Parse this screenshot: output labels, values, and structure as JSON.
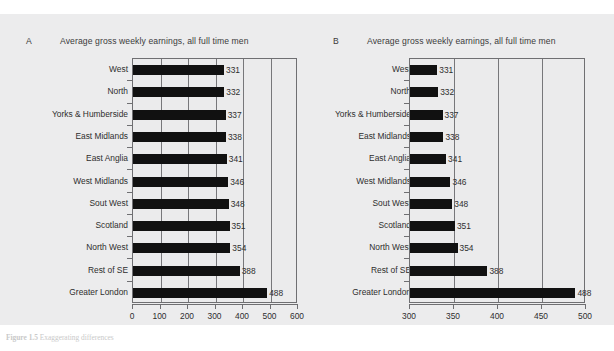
{
  "figure": {
    "caption_label": "Figure 1.5",
    "caption_text": "Exaggerating differences"
  },
  "colors": {
    "panel_background": "#ececed",
    "plot_background": "#ebebec",
    "bar_fill": "#111111",
    "axis_line": "#6f6f72",
    "gridline": "#77777a",
    "text": "#2e2e2e"
  },
  "categories": [
    "West",
    "North",
    "Yorks & Humberside",
    "East Midlands",
    "East Anglia",
    "West Midlands",
    "Sout West",
    "Scotland",
    "North West",
    "Rest of SE",
    "Greater London"
  ],
  "values": [
    331,
    332,
    337,
    338,
    341,
    346,
    348,
    351,
    354,
    388,
    488
  ],
  "value_labels": [
    "331",
    "332",
    "337",
    "338",
    "341",
    "346",
    "348",
    "351",
    "354",
    "388",
    "488"
  ],
  "panels": [
    {
      "letter": "A",
      "title": "Average gross weekly earnings, all full time men",
      "xlim": [
        0,
        600
      ],
      "xticks": [
        0,
        100,
        200,
        300,
        400,
        500,
        600
      ],
      "xticklabels": [
        "0",
        "100",
        "200",
        "300",
        "400",
        "500",
        "600"
      ]
    },
    {
      "letter": "B",
      "title": "Average gross weekly earnings, all full time men",
      "xlim": [
        300,
        500
      ],
      "xticks": [
        300,
        350,
        400,
        450,
        500
      ],
      "xticklabels": [
        "300",
        "350",
        "400",
        "450",
        "500"
      ]
    }
  ],
  "chart_data": {
    "type": "bar",
    "title": "Average gross weekly earnings, all full time men",
    "subtitle": "",
    "xlabel": "",
    "ylabel": "",
    "orientation": "horizontal",
    "grid": true,
    "legend": "none",
    "categories": [
      "West",
      "North",
      "Yorks & Humberside",
      "East Midlands",
      "East Anglia",
      "West Midlands",
      "Sout West",
      "Scotland",
      "North West",
      "Rest of SE",
      "Greater London"
    ],
    "values": [
      331,
      332,
      337,
      338,
      341,
      346,
      348,
      351,
      354,
      388,
      488
    ],
    "series": [
      {
        "name": "Average gross weekly earnings (all full time men)",
        "values": [
          331,
          332,
          337,
          338,
          341,
          346,
          348,
          351,
          354,
          388,
          488
        ]
      }
    ],
    "panels": [
      {
        "panel": "A",
        "title": "Average gross weekly earnings, all full time men",
        "xlim": [
          0,
          600
        ],
        "xticks": [
          0,
          100,
          200,
          300,
          400,
          500,
          600
        ],
        "note": "full axis starting at zero"
      },
      {
        "panel": "B",
        "title": "Average gross weekly earnings, all full time men",
        "xlim": [
          300,
          500
        ],
        "xticks": [
          300,
          350,
          400,
          450,
          500
        ],
        "note": "truncated axis starting at 300, exaggerating differences"
      }
    ]
  }
}
